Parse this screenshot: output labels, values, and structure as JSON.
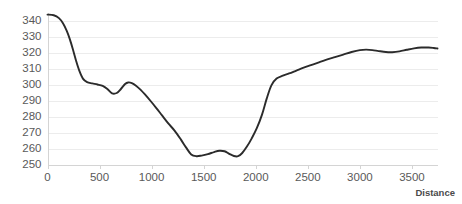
{
  "chart_data": {
    "type": "line",
    "title": "",
    "subtitle": "",
    "xlabel": "Distance",
    "ylabel": "",
    "xlim": [
      0,
      3750
    ],
    "ylim": [
      250,
      345
    ],
    "grid": true,
    "legend": false,
    "legend_position": "none",
    "x_ticks": [
      0,
      500,
      1000,
      1500,
      2000,
      2500,
      3000,
      3500
    ],
    "x_tick_labels": [
      "0",
      "500",
      "1000",
      "1500",
      "2000",
      "2500",
      "3000",
      "3500"
    ],
    "y_ticks": [
      250,
      260,
      270,
      280,
      290,
      300,
      310,
      320,
      330,
      340
    ],
    "y_tick_labels": [
      "250",
      "260",
      "270",
      "280",
      "290",
      "300",
      "310",
      "320",
      "330",
      "340"
    ],
    "series": [
      {
        "name": "elevation-profile",
        "color": "#2b2b2b",
        "line_width": 1.9,
        "x": [
          0,
          60,
          110,
          150,
          185,
          215,
          245,
          275,
          305,
          340,
          380,
          430,
          480,
          530,
          575,
          620,
          665,
          705,
          745,
          775,
          810,
          850,
          895,
          940,
          990,
          1045,
          1100,
          1160,
          1220,
          1280,
          1330,
          1380,
          1430,
          1480,
          1540,
          1600,
          1650,
          1700,
          1745,
          1790,
          1830,
          1870,
          1915,
          1960,
          2010,
          2060,
          2105,
          2150,
          2200,
          2260,
          2320,
          2390,
          2460,
          2530,
          2600,
          2680,
          2760,
          2840,
          2920,
          3000,
          3060,
          3120,
          3180,
          3250,
          3310,
          3380,
          3450,
          3520,
          3590,
          3660,
          3710,
          3745
        ],
        "y": [
          344.0,
          343.6,
          341.8,
          338.5,
          333.8,
          328.5,
          322.0,
          315.0,
          309.0,
          304.0,
          301.8,
          301.0,
          300.3,
          299.4,
          297.5,
          294.8,
          295.0,
          297.5,
          300.6,
          301.6,
          301.2,
          299.6,
          297.0,
          293.8,
          290.0,
          285.6,
          281.0,
          276.0,
          271.5,
          266.0,
          261.0,
          256.6,
          255.5,
          255.9,
          256.8,
          258.1,
          258.9,
          258.6,
          257.0,
          255.6,
          255.5,
          257.5,
          261.5,
          266.5,
          273.0,
          281.5,
          291.5,
          299.8,
          304.0,
          305.8,
          307.2,
          309.0,
          310.8,
          312.4,
          314.0,
          315.8,
          317.4,
          319.0,
          320.6,
          321.8,
          322.1,
          321.8,
          321.2,
          320.6,
          320.5,
          321.0,
          322.0,
          322.9,
          323.4,
          323.4,
          323.1,
          322.8
        ]
      }
    ],
    "annotations": []
  },
  "axes": {
    "x_axis_title": "Distance"
  }
}
